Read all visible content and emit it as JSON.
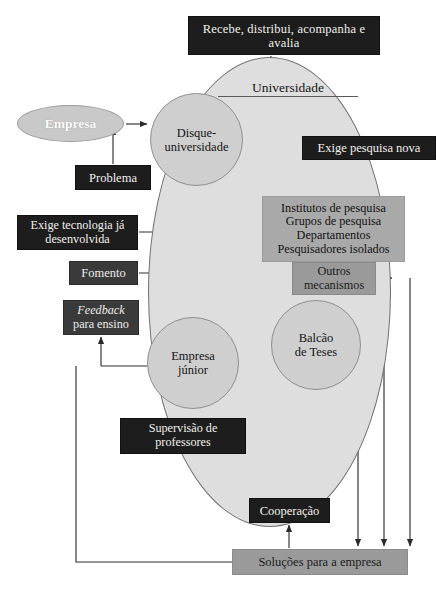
{
  "figure": {
    "kind": "flow-diagram",
    "language": "pt-BR",
    "caption": "",
    "palette": {
      "box_dark": "#1d1d1d",
      "box_mid": "#3a3a3a",
      "box_gray": "#9a9a9a",
      "ellipse_university": "#dedede",
      "circle_fill": "#cfcfcf",
      "empresa_fill": "#c9c9c9",
      "page_background": "#ffffff"
    }
  },
  "nodes": {
    "recebe": "Recebe, distribui, acompanha e avalia",
    "universidade": "Universidade",
    "empresa": "Empresa",
    "problema": "Problema",
    "disque_line1": "Disque-",
    "disque_line2": "universidade",
    "exige_pesquisa_nova": "Exige pesquisa nova",
    "institutos": [
      "Institutos de pesquisa",
      "Grupos de pesquisa",
      "Departamentos",
      "Pesquisadores isolados"
    ],
    "exige_tecnologia": "Exige tecnologia já desenvolvida",
    "fomento": "Fomento",
    "outros_line1": "Outros",
    "outros_line2": "mecanismos",
    "feedback_line1": "Feedback",
    "feedback_line2": "para ensino",
    "empresa_junior_line1": "Empresa",
    "empresa_junior_line2": "júnior",
    "balcao_line1": "Balcão",
    "balcao_line2": "de Teses",
    "supervisao_line1": "Supervisão de",
    "supervisao_line2": "professores",
    "cooperacao": "Cooperação",
    "solucoes": "Soluções para a empresa"
  }
}
